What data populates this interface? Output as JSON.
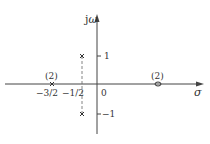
{
  "diagram": {
    "axes": {
      "vertical_label_prefix": "j",
      "vertical_label_symbol": "ω",
      "horizontal_label": "σ",
      "origin_label": "0"
    },
    "ticks": {
      "imag_pos": "1",
      "imag_neg": "−1",
      "real_neg_three_halves": "−3/2",
      "real_neg_half": "−1/2"
    },
    "poles": [
      {
        "re": "-3/2",
        "im": "0",
        "multiplicity_label": "(2)",
        "marker": "cross"
      },
      {
        "re": "-1/2",
        "im": "1",
        "marker": "cross"
      },
      {
        "re": "-1/2",
        "im": "-1",
        "marker": "cross"
      }
    ],
    "zeros": [
      {
        "re": "2",
        "im": "0",
        "multiplicity_label": "(2)",
        "marker": "circle"
      }
    ],
    "colors": {
      "axis": "#444444",
      "marker": "#333333",
      "dashed": "#666666"
    }
  }
}
